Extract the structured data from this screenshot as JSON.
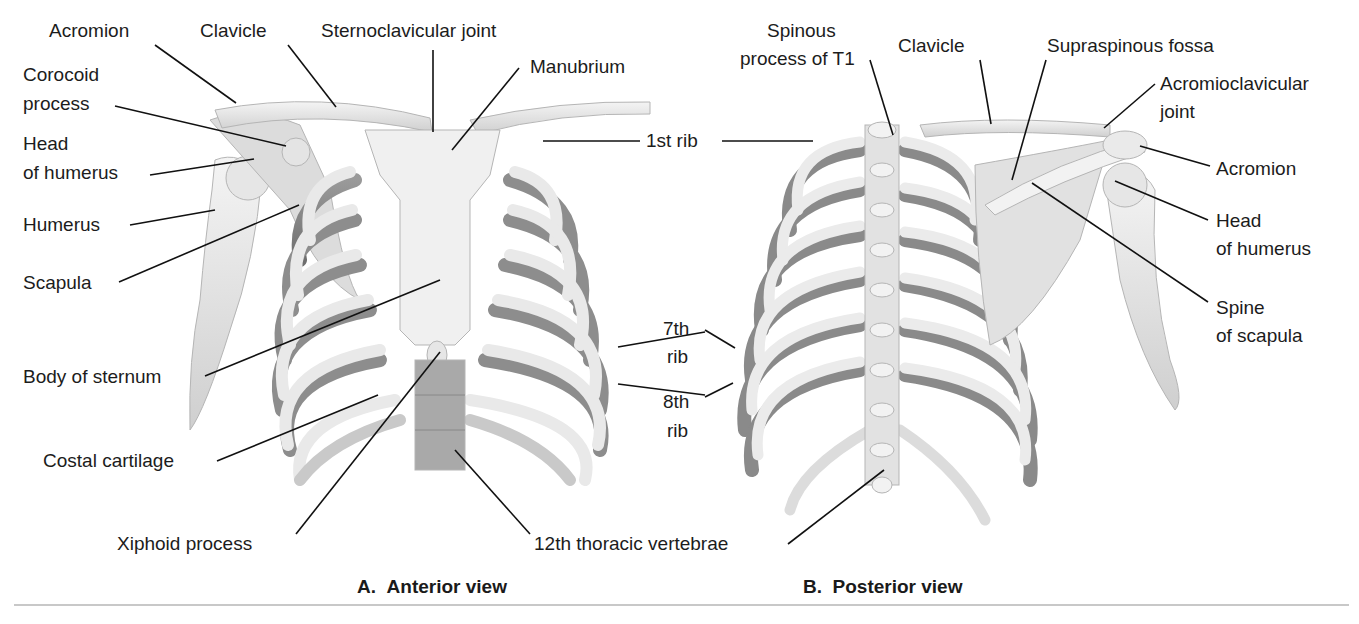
{
  "figure": {
    "panels": [
      {
        "id": "A",
        "caption_letter": "A.",
        "caption_text": "Anterior view",
        "labels": {
          "acromion": "Acromion",
          "clavicle": "Clavicle",
          "sternoclavicular_joint": "Sternoclavicular joint",
          "manubrium": "Manubrium",
          "corocoid_process_1": "Corocoid",
          "corocoid_process_2": "process",
          "head_of_humerus_1": "Head",
          "head_of_humerus_2": "of humerus",
          "humerus": "Humerus",
          "scapula": "Scapula",
          "body_of_sternum": "Body of sternum",
          "costal_cartilage": "Costal cartilage",
          "xiphoid_process": "Xiphoid process",
          "first_rib": "1st rib",
          "seventh_rib_1": "7th",
          "seventh_rib_2": "rib",
          "eighth_rib_1": "8th",
          "eighth_rib_2": "rib",
          "twelfth_thoracic_vertebrae": "12th thoracic vertebrae"
        }
      },
      {
        "id": "B",
        "caption_letter": "B.",
        "caption_text": "Posterior view",
        "labels": {
          "spinous_process_1": "Spinous",
          "spinous_process_2": "process of T1",
          "clavicle": "Clavicle",
          "supraspinous_fossa": "Supraspinous fossa",
          "acromioclavicular_joint_1": "Acromioclavicular",
          "acromioclavicular_joint_2": "joint",
          "acromion": "Acromion",
          "head_of_humerus_1": "Head",
          "head_of_humerus_2": "of humerus",
          "spine_of_scapula_1": "Spine",
          "spine_of_scapula_2": "of scapula"
        }
      }
    ],
    "colors": {
      "bone_light": "#ececec",
      "bone_mid": "#cfcfcf",
      "bone_shadow": "#8a8a8a",
      "leader_line": "#111111",
      "divider": "#c8c8c8"
    }
  }
}
